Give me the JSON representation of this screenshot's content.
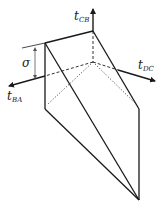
{
  "diagram": {
    "axes": [
      {
        "id": "t_CB",
        "symbol": "t",
        "subscript": "CB",
        "direction": "up"
      },
      {
        "id": "t_DC",
        "symbol": "t",
        "subscript": "DC",
        "direction": "right-down"
      },
      {
        "id": "t_BA",
        "symbol": "t",
        "subscript": "BA",
        "direction": "left-down"
      }
    ],
    "sigma_label": "σ",
    "colors": {
      "line": "#1a1a1a",
      "background": "#ffffff",
      "dashed": "#333333"
    }
  }
}
